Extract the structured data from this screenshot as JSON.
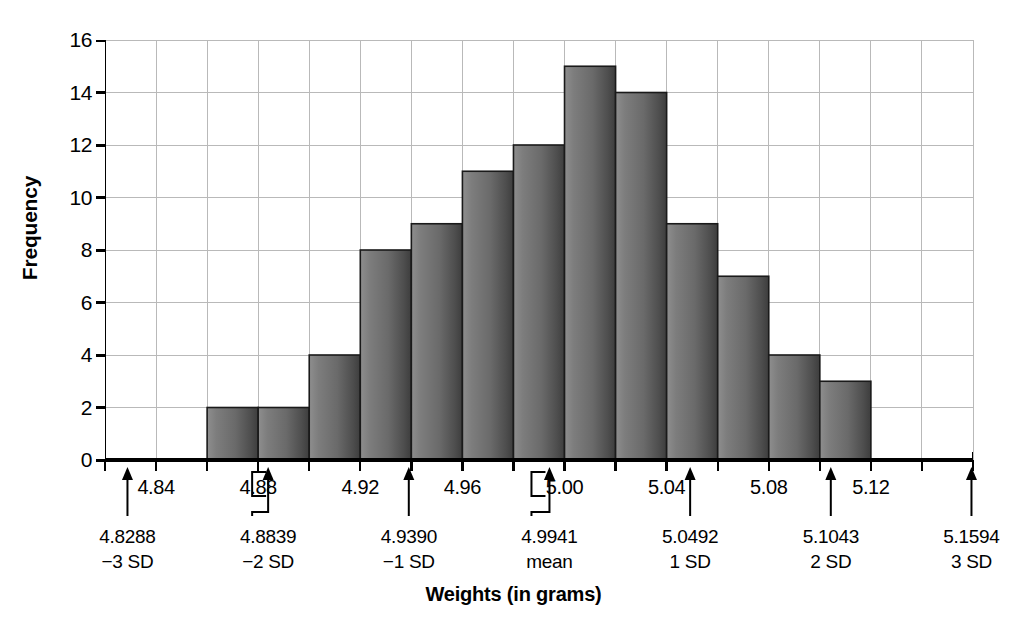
{
  "chart_data": {
    "type": "bar",
    "title": "",
    "xlabel": "Weights (in grams)",
    "ylabel": "Frequency",
    "ylim": [
      0,
      16
    ],
    "ytick_values": [
      0,
      2,
      4,
      6,
      8,
      10,
      12,
      14,
      16
    ],
    "ytick_labels": [
      "0",
      "2",
      "4",
      "6",
      "8",
      "10",
      "12",
      "14",
      "16"
    ],
    "xlim": [
      4.82,
      5.16
    ],
    "xtick_labels": [
      "4.84",
      "4.88",
      "4.92",
      "4.96",
      "5.00",
      "5.04",
      "5.08",
      "5.12"
    ],
    "xtick_values": [
      4.84,
      4.88,
      4.92,
      4.96,
      5.0,
      5.04,
      5.08,
      5.12
    ],
    "bin_width": 0.02,
    "bin_starts": [
      4.86,
      4.88,
      4.9,
      4.92,
      4.94,
      4.96,
      4.98,
      5.0,
      5.02,
      5.04,
      5.06,
      5.08,
      5.1
    ],
    "categories": [
      "4.86-4.88",
      "4.88-4.90",
      "4.90-4.92",
      "4.92-4.94",
      "4.94-4.96",
      "4.96-4.98",
      "4.98-5.00",
      "5.00-5.02",
      "5.02-5.04",
      "5.04-5.06",
      "5.06-5.08",
      "5.08-5.10",
      "5.10-5.12"
    ],
    "values": [
      2,
      2,
      4,
      8,
      9,
      11,
      12,
      15,
      14,
      9,
      7,
      4,
      3
    ],
    "grid": true,
    "legend": "none",
    "bar_color": "#6f6f6f",
    "bar_edge_color": "#1a1a1a",
    "grid_color": "#b9b9b9",
    "axis_color": "#000000",
    "annotations": [
      {
        "value": "4.8288",
        "name": "−3 SD",
        "x": 4.8288
      },
      {
        "value": "4.8839",
        "name": "−2 SD",
        "x": 4.8839
      },
      {
        "value": "4.9390",
        "name": "−1 SD",
        "x": 4.939
      },
      {
        "value": "4.9941",
        "name": "mean",
        "x": 4.9941
      },
      {
        "value": "5.0492",
        "name": "1 SD",
        "x": 5.0492
      },
      {
        "value": "5.1043",
        "name": "2 SD",
        "x": 5.1043
      },
      {
        "value": "5.1594",
        "name": "3 SD",
        "x": 5.1594
      }
    ]
  }
}
